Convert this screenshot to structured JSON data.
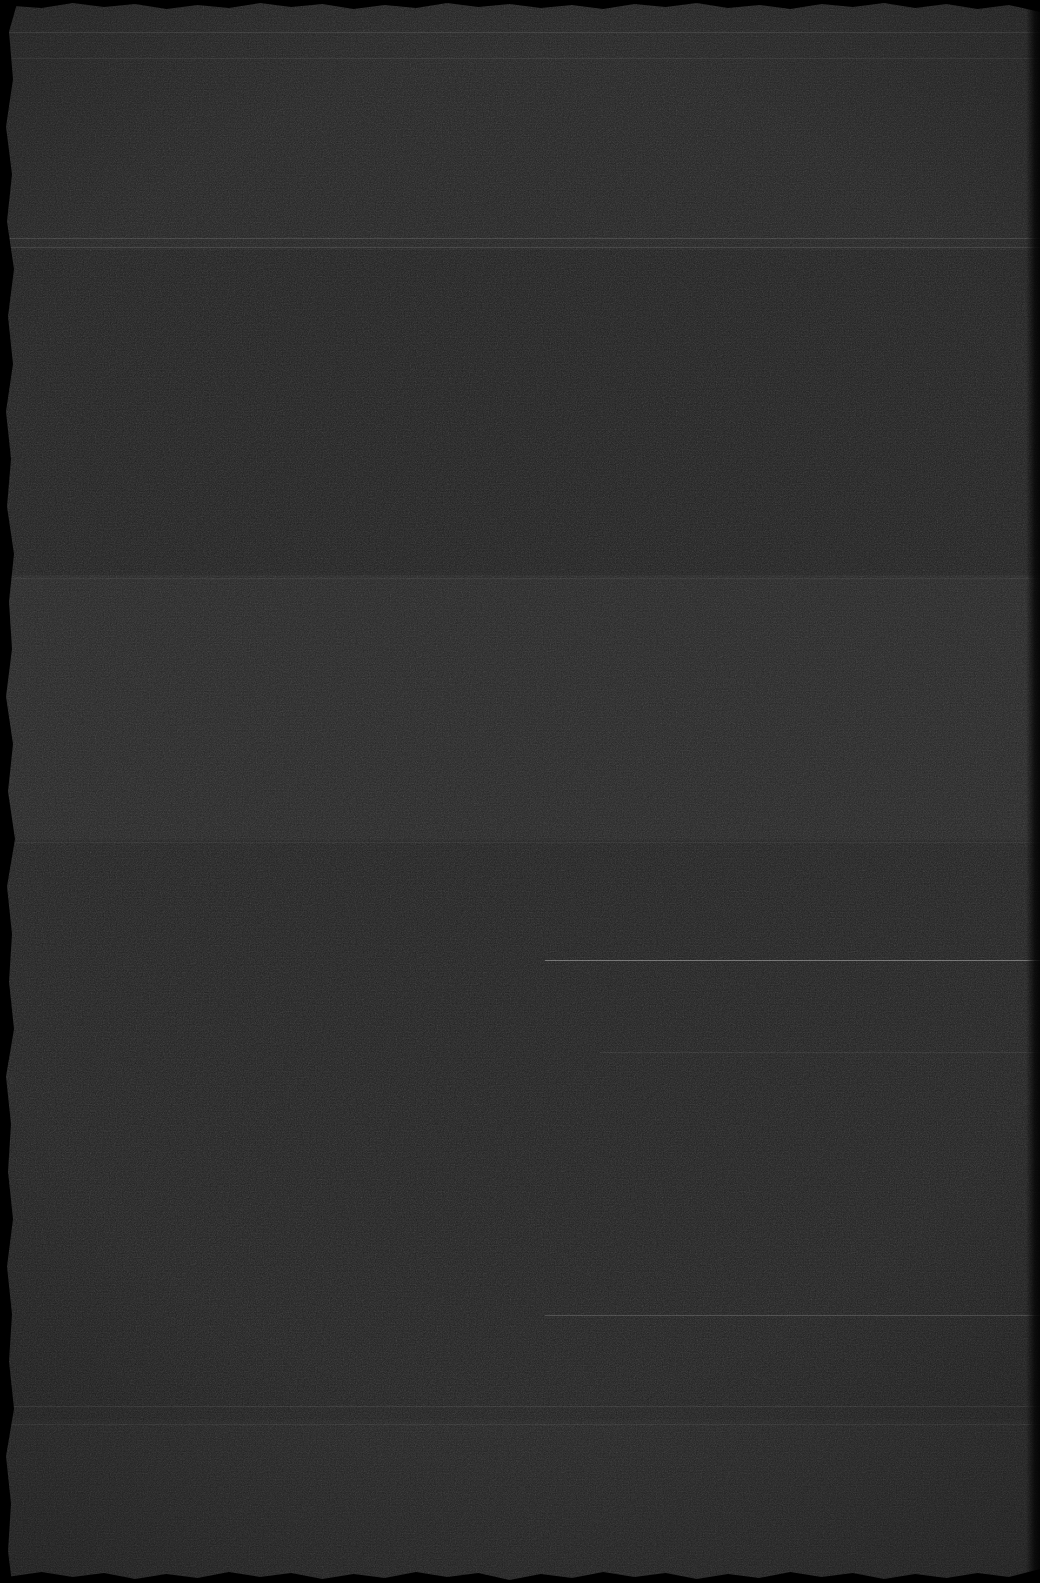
{
  "image": {
    "kind": "underexposed-scan",
    "width": 1040,
    "height": 1583,
    "base_color": "#202020",
    "has_legible_text": false,
    "has_icons": false,
    "has_widgets": false,
    "description": "Near-black heavily grained scan with horizontal tonal banding, faint scanline rules and torn dark edges. No readable content."
  },
  "bands": [
    {
      "name": "band-top",
      "top": 0,
      "height": 250,
      "color": "#242424"
    },
    {
      "name": "band-upper-middle",
      "top": 250,
      "height": 325,
      "color": "#212121"
    },
    {
      "name": "band-middle",
      "top": 575,
      "height": 265,
      "color": "#272727"
    },
    {
      "name": "band-lower-middle",
      "top": 840,
      "height": 580,
      "color": "#222222"
    },
    {
      "name": "band-bottom",
      "top": 1420,
      "height": 163,
      "color": "#252525"
    }
  ],
  "rules": [
    {
      "name": "rule-a",
      "top": 32,
      "left": 0,
      "width": 1040,
      "color": "rgba(255,255,255,0.10)"
    },
    {
      "name": "rule-b",
      "top": 58,
      "left": 0,
      "width": 1040,
      "color": "rgba(255,255,255,0.07)"
    },
    {
      "name": "rule-c",
      "top": 238,
      "left": 0,
      "width": 1040,
      "color": "rgba(255,255,255,0.14)"
    },
    {
      "name": "rule-d",
      "top": 247,
      "left": 0,
      "width": 1040,
      "color": "rgba(255,255,255,0.11)"
    },
    {
      "name": "rule-e",
      "top": 578,
      "left": 0,
      "width": 1040,
      "color": "rgba(255,255,255,0.06)"
    },
    {
      "name": "rule-f",
      "top": 842,
      "left": 0,
      "width": 1040,
      "color": "rgba(255,255,255,0.06)"
    },
    {
      "name": "rule-g",
      "top": 960,
      "left": 545,
      "width": 495,
      "color": "rgba(255,255,255,0.34)"
    },
    {
      "name": "rule-h",
      "top": 1052,
      "left": 600,
      "width": 440,
      "color": "rgba(255,255,255,0.07)"
    },
    {
      "name": "rule-i",
      "top": 1315,
      "left": 545,
      "width": 495,
      "color": "rgba(255,255,255,0.18)"
    },
    {
      "name": "rule-j",
      "top": 1406,
      "left": 0,
      "width": 1040,
      "color": "rgba(255,255,255,0.09)"
    },
    {
      "name": "rule-k",
      "top": 1424,
      "left": 0,
      "width": 1040,
      "color": "rgba(255,255,255,0.07)"
    }
  ]
}
